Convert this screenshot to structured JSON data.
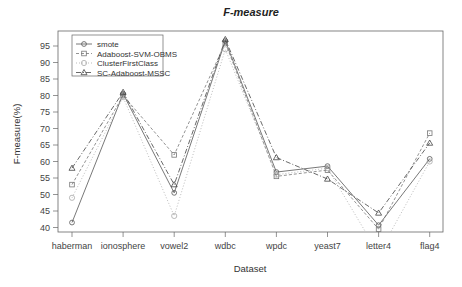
{
  "chart_data": {
    "type": "line",
    "title": "F-measure",
    "xlabel": "Dataset",
    "ylabel": "F-measure(%)",
    "categories": [
      "haberman",
      "ionosphere",
      "vowel2",
      "wdbc",
      "wpdc",
      "yeast7",
      "letter4",
      "flag4"
    ],
    "ylim": [
      39,
      98
    ],
    "yticks": [
      40,
      45,
      50,
      55,
      60,
      65,
      70,
      75,
      80,
      85,
      90,
      95
    ],
    "grid": false,
    "legend_position": "top-left",
    "series": [
      {
        "name": "smote",
        "marker": "circle",
        "dash": "",
        "color": "#555555",
        "values": [
          41.5,
          80.5,
          50.5,
          96.5,
          56.8,
          58.6,
          40.7,
          60.8
        ]
      },
      {
        "name": "Adaboost-SVM-OBMS",
        "marker": "square",
        "dash": "3,2",
        "color": "#777777",
        "values": [
          53,
          80,
          62,
          96,
          55.5,
          57.4,
          39.5,
          68.6
        ]
      },
      {
        "name": "ClusterFirstClass",
        "marker": "diamond",
        "dash": "1,2",
        "color": "#aaaaaa",
        "values": [
          49,
          79.5,
          43.5,
          94,
          56,
          58,
          32,
          60
        ]
      },
      {
        "name": "SC-Adaboost-MSSC",
        "marker": "triangle",
        "dash": "5,2,1,2",
        "color": "#444444",
        "values": [
          58,
          81,
          53,
          97,
          61.2,
          54.7,
          44.4,
          65.6
        ]
      }
    ]
  }
}
